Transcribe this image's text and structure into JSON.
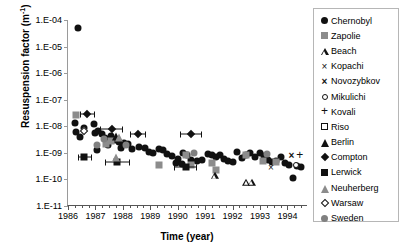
{
  "chart_data": {
    "type": "scatter",
    "title": "",
    "xlabel": "Time (year)",
    "ylabel_text": "Resuspension factor (m",
    "ylabel_sup": "-1",
    "ylabel_tail": ")",
    "xlim": [
      1986,
      1994.75
    ],
    "ylim": [
      1e-11,
      0.0001
    ],
    "yscale": "log",
    "grid": false,
    "legend_position": "right-outside",
    "xticks": [
      1986,
      1987,
      1988,
      1989,
      1990,
      1991,
      1992,
      1993,
      1994
    ],
    "xticklabels": [
      "1986",
      "1987",
      "1988",
      "1989",
      "1990",
      "1991",
      "1992",
      "1993",
      "1994"
    ],
    "xminor_per_major": 4,
    "yticks": [
      0.0001,
      1e-05,
      1e-06,
      1e-07,
      1e-08,
      1e-09,
      1e-10,
      1e-11
    ],
    "yticklabels": [
      "1.E-04",
      "1.E-05",
      "1.E-06",
      "1.E-07",
      "1.E-08",
      "1.E-09",
      "1.E-10",
      "1.E-11"
    ],
    "series": [
      {
        "name": "Chernobyl",
        "marker": "circle-filled",
        "color": "#111111",
        "points": [
          {
            "x": 1986.35,
            "y": 5e-05
          },
          {
            "x": 1986.25,
            "y": 1.3e-08
          },
          {
            "x": 1986.3,
            "y": 6e-09
          },
          {
            "x": 1986.45,
            "y": 4e-09
          },
          {
            "x": 1986.6,
            "y": 9e-09
          },
          {
            "x": 1986.95,
            "y": 1.2e-08
          },
          {
            "x": 1987.0,
            "y": 5.5e-09
          },
          {
            "x": 1987.1,
            "y": 6.5e-09
          },
          {
            "x": 1987.25,
            "y": 5e-09
          },
          {
            "x": 1987.35,
            "y": 3.5e-09
          },
          {
            "x": 1987.45,
            "y": 2e-09
          },
          {
            "x": 1987.55,
            "y": 4.2e-09
          },
          {
            "x": 1987.7,
            "y": 3e-09
          },
          {
            "x": 1987.85,
            "y": 2.6e-09
          },
          {
            "x": 1987.95,
            "y": 1.5e-09
          },
          {
            "x": 1988.05,
            "y": 2.4e-09
          },
          {
            "x": 1988.2,
            "y": 2.2e-09
          },
          {
            "x": 1988.35,
            "y": 1.4e-09
          },
          {
            "x": 1987.05,
            "y": 1.3e-09
          },
          {
            "x": 1988.6,
            "y": 1.6e-09
          },
          {
            "x": 1988.8,
            "y": 1.5e-09
          },
          {
            "x": 1988.95,
            "y": 1.1e-09
          },
          {
            "x": 1989.1,
            "y": 1e-09
          },
          {
            "x": 1989.3,
            "y": 1.35e-09
          },
          {
            "x": 1989.45,
            "y": 1.25e-09
          },
          {
            "x": 1989.6,
            "y": 9e-10
          },
          {
            "x": 1989.8,
            "y": 7.5e-10
          },
          {
            "x": 1990.0,
            "y": 6e-10
          },
          {
            "x": 1990.2,
            "y": 1e-09
          },
          {
            "x": 1990.35,
            "y": 8.5e-10
          },
          {
            "x": 1990.5,
            "y": 5.5e-10
          },
          {
            "x": 1990.7,
            "y": 5e-10
          },
          {
            "x": 1990.9,
            "y": 5.2e-10
          },
          {
            "x": 1991.1,
            "y": 9e-10
          },
          {
            "x": 1991.25,
            "y": 8e-10
          },
          {
            "x": 1991.4,
            "y": 7e-10
          },
          {
            "x": 1991.55,
            "y": 8.5e-10
          },
          {
            "x": 1991.7,
            "y": 6e-10
          },
          {
            "x": 1991.85,
            "y": 5e-10
          },
          {
            "x": 1992.0,
            "y": 4.5e-10
          },
          {
            "x": 1992.15,
            "y": 1.1e-09
          },
          {
            "x": 1992.35,
            "y": 6.5e-10
          },
          {
            "x": 1992.5,
            "y": 8.5e-10
          },
          {
            "x": 1992.65,
            "y": 9.5e-10
          },
          {
            "x": 1992.8,
            "y": 7e-10
          },
          {
            "x": 1993.0,
            "y": 1e-09
          },
          {
            "x": 1993.15,
            "y": 7.5e-10
          },
          {
            "x": 1993.3,
            "y": 5.5e-10
          },
          {
            "x": 1993.45,
            "y": 4.5e-10
          },
          {
            "x": 1993.6,
            "y": 5e-10
          },
          {
            "x": 1993.75,
            "y": 7e-10
          },
          {
            "x": 1993.9,
            "y": 4e-10
          },
          {
            "x": 1994.05,
            "y": 3.5e-10
          },
          {
            "x": 1994.35,
            "y": 3.2e-10
          },
          {
            "x": 1994.5,
            "y": 3e-10
          },
          {
            "x": 1994.2,
            "y": 1.1e-10
          },
          {
            "x": 1989.95,
            "y": 4e-10
          },
          {
            "x": 1990.15,
            "y": 3.8e-10
          }
        ]
      },
      {
        "name": "Zapolie",
        "marker": "square-gray",
        "color": "#8c8c8c",
        "points": [
          {
            "x": 1986.3,
            "y": 2.6e-08
          },
          {
            "x": 1987.55,
            "y": 2.8e-09
          },
          {
            "x": 1987.4,
            "y": 2.2e-09
          },
          {
            "x": 1990.3,
            "y": 8.5e-10
          },
          {
            "x": 1990.5,
            "y": 3.5e-10
          },
          {
            "x": 1991.25,
            "y": 4e-10
          },
          {
            "x": 1991.4,
            "y": 2.2e-10
          },
          {
            "x": 1992.5,
            "y": 8e-10
          },
          {
            "x": 1993.1,
            "y": 5e-10
          },
          {
            "x": 1993.6,
            "y": 4.5e-10
          },
          {
            "x": 1989.3,
            "y": 3.5e-10
          }
        ]
      },
      {
        "name": "Beach",
        "marker": "triangle-open",
        "color": "#111111",
        "points": [
          {
            "x": 1991.35,
            "y": 1.3e-10
          },
          {
            "x": 1992.5,
            "y": 7.5e-11
          },
          {
            "x": 1992.7,
            "y": 7.5e-11
          }
        ]
      },
      {
        "name": "Kopachi",
        "marker": "x",
        "color": "#111111",
        "points": [
          {
            "x": 1993.4,
            "y": 3e-10
          }
        ]
      },
      {
        "name": "Novozybkov",
        "marker": "x-bold",
        "color": "#111111",
        "points": [
          {
            "x": 1994.15,
            "y": 8.5e-10
          }
        ]
      },
      {
        "name": "Mikulichi",
        "marker": "circle-open",
        "color": "#111111",
        "points": [
          {
            "x": 1994.3,
            "y": 3.6e-10
          }
        ]
      },
      {
        "name": "Kovali",
        "marker": "plus",
        "color": "#111111",
        "points": [
          {
            "x": 1994.45,
            "y": 8.5e-10
          }
        ]
      },
      {
        "name": "Riso",
        "marker": "square-open",
        "color": "#111111",
        "points": []
      },
      {
        "name": "Berlin",
        "marker": "triangle-filled",
        "color": "#111111",
        "points": [
          {
            "x": 1987.75,
            "y": 4e-09
          }
        ]
      },
      {
        "name": "Compton",
        "marker": "diamond",
        "color": "#111111",
        "points": [
          {
            "x": 1986.7,
            "y": 3e-08,
            "xerr_lo": 0.28,
            "xerr_hi": 0.3
          },
          {
            "x": 1987.6,
            "y": 8e-09,
            "xerr_lo": 0.45,
            "xerr_hi": 0.42
          },
          {
            "x": 1988.55,
            "y": 5e-09,
            "xerr_lo": 0.3,
            "xerr_hi": 0.3
          },
          {
            "x": 1990.5,
            "y": 5e-09,
            "xerr_lo": 0.4,
            "xerr_hi": 0.4
          }
        ]
      },
      {
        "name": "Lerwick",
        "marker": "square-black",
        "color": "#111111",
        "points": [
          {
            "x": 1986.6,
            "y": 7e-10,
            "xerr_lo": 0.25,
            "xerr_hi": 0.28
          },
          {
            "x": 1987.8,
            "y": 4.5e-10,
            "xerr_lo": 0.45,
            "xerr_hi": 0.45
          },
          {
            "x": 1990.3,
            "y": 3e-10,
            "xerr_lo": 0.42,
            "xerr_hi": 0.42
          }
        ]
      },
      {
        "name": "Neuherberg",
        "marker": "triangle-gray",
        "color": "#8c8c8c",
        "points": [
          {
            "x": 1987.75,
            "y": 6.5e-10
          },
          {
            "x": 1987.85,
            "y": 3.6e-09
          }
        ]
      },
      {
        "name": "Warsaw",
        "marker": "diamond-open",
        "color": "#111111",
        "points": [
          {
            "x": 1986.6,
            "y": 6.5e-09
          }
        ]
      },
      {
        "name": "Sweden",
        "marker": "circle-gray",
        "color": "#808080",
        "points": [
          {
            "x": 1987.3,
            "y": 3.2e-09
          },
          {
            "x": 1987.05,
            "y": 2e-09
          },
          {
            "x": 1988.1,
            "y": 2e-09
          },
          {
            "x": 1990.6,
            "y": 1e-09
          },
          {
            "x": 1993.25,
            "y": 9e-10
          }
        ]
      }
    ]
  },
  "legend": {
    "items": [
      {
        "label": "Chernobyl",
        "marker": "circle-filled"
      },
      {
        "label": "Zapolie",
        "marker": "square-gray"
      },
      {
        "label": "Beach",
        "marker": "triangle-open"
      },
      {
        "label": "Kopachi",
        "marker": "x"
      },
      {
        "label": "Novozybkov",
        "marker": "x-bold"
      },
      {
        "label": "Mikulichi",
        "marker": "circle-open"
      },
      {
        "label": "Kovali",
        "marker": "plus"
      },
      {
        "label": "Riso",
        "marker": "square-open"
      },
      {
        "label": "Berlin",
        "marker": "triangle-filled"
      },
      {
        "label": "Compton",
        "marker": "diamond"
      },
      {
        "label": "Lerwick",
        "marker": "square-black"
      },
      {
        "label": "Neuherberg",
        "marker": "triangle-gray"
      },
      {
        "label": "Warsaw",
        "marker": "diamond-open"
      },
      {
        "label": "Sweden",
        "marker": "circle-gray"
      }
    ]
  },
  "colors": {
    "marker_black": "#111111",
    "marker_gray": "#8c8c8c",
    "axis": "#555555",
    "axis_light": "#9a9a9a",
    "legend_border": "#b6b6b6",
    "background": "#ffffff"
  }
}
